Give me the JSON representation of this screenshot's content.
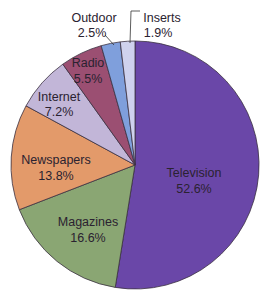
{
  "chart_data": {
    "type": "pie",
    "title": "",
    "start_angle": "12 o'clock",
    "direction": "clockwise",
    "legend": "none (direct labels)",
    "categories": [
      "Television",
      "Magazines",
      "Newspapers",
      "Internet",
      "Radio",
      "Outdoor",
      "Inserts"
    ],
    "values": [
      52.6,
      16.6,
      13.8,
      7.2,
      5.5,
      2.5,
      1.9
    ],
    "labels": [
      "52.6%",
      "16.6%",
      "13.8%",
      "7.2%",
      "5.5%",
      "2.5%",
      "1.9%"
    ],
    "colors": [
      "#6a47a8",
      "#8aa673",
      "#e39a6a",
      "#c2b6d8",
      "#9b4f72",
      "#7f9fdc",
      "#cfd2ee"
    ],
    "slice_border": "#3a3040"
  }
}
